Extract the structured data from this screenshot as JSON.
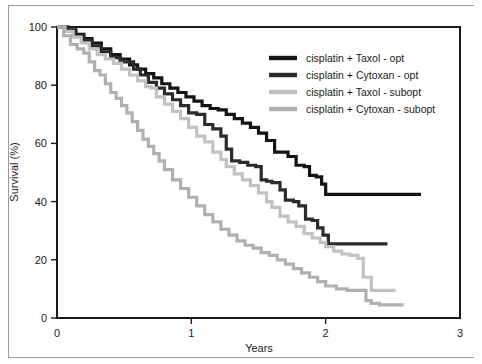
{
  "figure": {
    "background_color": "#ffffff",
    "axis_color": "#1a1a1a"
  },
  "chart_data": {
    "type": "line",
    "title": "",
    "subtitle": "",
    "xlabel": "Years",
    "ylabel": "Survival (%)",
    "xlim": [
      0,
      3
    ],
    "ylim": [
      0,
      100
    ],
    "xticks": [
      0,
      1,
      2,
      3
    ],
    "xticklabels": [
      "0",
      "1",
      "2",
      "3"
    ],
    "yticks": [
      0,
      20,
      40,
      60,
      80,
      100
    ],
    "yticklabels": [
      "0",
      "20",
      "40",
      "60",
      "80",
      "100"
    ],
    "grid": false,
    "drawstyle": "steps-post",
    "legend_position": "upper right",
    "series": [
      {
        "name": "cisplatin + Taxol - opt",
        "color": "#141414",
        "linewidth": 3.2,
        "x": [
          0.0,
          0.08,
          0.14,
          0.2,
          0.26,
          0.33,
          0.4,
          0.47,
          0.54,
          0.6,
          0.66,
          0.72,
          0.78,
          0.84,
          0.9,
          0.96,
          1.02,
          1.08,
          1.14,
          1.2,
          1.26,
          1.32,
          1.38,
          1.44,
          1.5,
          1.56,
          1.58,
          1.62,
          1.68,
          1.72,
          1.78,
          1.84,
          1.88,
          1.93,
          1.97,
          2.0,
          2.71
        ],
        "y": [
          100.0,
          99.0,
          97.5,
          96.0,
          94.5,
          92.5,
          90.5,
          89.0,
          87.0,
          85.5,
          84.0,
          82.5,
          80.5,
          79.0,
          77.5,
          76.0,
          74.5,
          73.0,
          72.0,
          71.5,
          70.0,
          68.5,
          67.0,
          65.5,
          63.5,
          61.0,
          61.0,
          57.0,
          57.0,
          55.5,
          52.5,
          52.0,
          49.0,
          48.5,
          46.0,
          42.5,
          42.5
        ]
      },
      {
        "name": "cisplatin + Cytoxan - opt",
        "color": "#2b2b2b",
        "linewidth": 3.2,
        "x": [
          0.0,
          0.08,
          0.14,
          0.2,
          0.26,
          0.33,
          0.4,
          0.47,
          0.52,
          0.57,
          0.62,
          0.68,
          0.74,
          0.8,
          0.86,
          0.92,
          0.98,
          1.04,
          1.1,
          1.16,
          1.22,
          1.26,
          1.3,
          1.36,
          1.42,
          1.48,
          1.52,
          1.56,
          1.6,
          1.66,
          1.7,
          1.76,
          1.8,
          1.85,
          1.9,
          1.94,
          1.98,
          2.02,
          2.46
        ],
        "y": [
          100.0,
          98.5,
          97.0,
          95.5,
          93.5,
          91.5,
          89.5,
          88.0,
          88.0,
          85.5,
          83.5,
          81.0,
          79.0,
          77.0,
          75.0,
          73.0,
          70.5,
          70.0,
          66.5,
          65.0,
          62.5,
          58.0,
          54.0,
          53.5,
          52.5,
          52.0,
          47.5,
          47.0,
          46.5,
          44.0,
          40.5,
          40.0,
          38.5,
          34.0,
          33.5,
          31.0,
          28.5,
          25.5,
          25.5
        ]
      },
      {
        "name": "cisplatin + Taxol - subopt",
        "color": "#c2c2c2",
        "linewidth": 3.2,
        "x": [
          0.0,
          0.06,
          0.12,
          0.18,
          0.24,
          0.3,
          0.36,
          0.42,
          0.48,
          0.54,
          0.6,
          0.66,
          0.7,
          0.74,
          0.8,
          0.86,
          0.92,
          0.98,
          1.04,
          1.1,
          1.16,
          1.22,
          1.26,
          1.32,
          1.38,
          1.44,
          1.5,
          1.56,
          1.6,
          1.66,
          1.72,
          1.78,
          1.84,
          1.9,
          1.96,
          2.0,
          2.06,
          2.12,
          2.18,
          2.24,
          2.28,
          2.34,
          2.52
        ],
        "y": [
          100.0,
          98.5,
          96.5,
          94.5,
          92.5,
          90.5,
          89.0,
          87.5,
          85.5,
          83.5,
          81.5,
          79.5,
          79.0,
          76.0,
          73.5,
          71.0,
          68.5,
          65.5,
          62.5,
          60.5,
          57.0,
          54.5,
          52.0,
          49.5,
          47.5,
          45.5,
          43.0,
          40.0,
          38.0,
          35.0,
          33.0,
          31.5,
          29.0,
          27.5,
          26.0,
          24.5,
          23.0,
          22.0,
          21.5,
          20.5,
          14.0,
          9.5,
          9.5
        ]
      },
      {
        "name": "cisplatin + Cytoxan - subopt",
        "color": "#b0b0b0",
        "linewidth": 3.2,
        "x": [
          0.0,
          0.05,
          0.1,
          0.15,
          0.2,
          0.24,
          0.28,
          0.32,
          0.36,
          0.4,
          0.44,
          0.48,
          0.52,
          0.56,
          0.6,
          0.64,
          0.68,
          0.72,
          0.76,
          0.8,
          0.86,
          0.92,
          0.98,
          1.04,
          1.1,
          1.16,
          1.22,
          1.28,
          1.34,
          1.4,
          1.46,
          1.52,
          1.58,
          1.64,
          1.7,
          1.76,
          1.82,
          1.88,
          1.94,
          2.0,
          2.08,
          2.16,
          2.24,
          2.3,
          2.34,
          2.4,
          2.58
        ],
        "y": [
          100.0,
          97.0,
          94.0,
          92.5,
          91.0,
          88.0,
          85.0,
          83.5,
          80.5,
          77.5,
          75.5,
          73.0,
          70.5,
          67.5,
          64.5,
          61.5,
          59.0,
          56.5,
          54.0,
          51.0,
          47.5,
          44.5,
          41.5,
          38.5,
          35.5,
          33.0,
          30.5,
          28.5,
          26.5,
          25.0,
          24.0,
          22.5,
          21.5,
          20.0,
          18.5,
          17.0,
          15.5,
          14.0,
          12.5,
          11.0,
          10.0,
          9.5,
          9.5,
          6.0,
          5.0,
          4.5,
          4.5
        ]
      }
    ],
    "legend": [
      {
        "label": "cisplatin + Taxol - opt",
        "color": "#141414"
      },
      {
        "label": "cisplatin + Cytoxan - opt",
        "color": "#2b2b2b"
      },
      {
        "label": "cisplatin + Taxol - subopt",
        "color": "#c2c2c2"
      },
      {
        "label": "cisplatin + Cytoxan - subopt",
        "color": "#b0b0b0"
      }
    ]
  }
}
